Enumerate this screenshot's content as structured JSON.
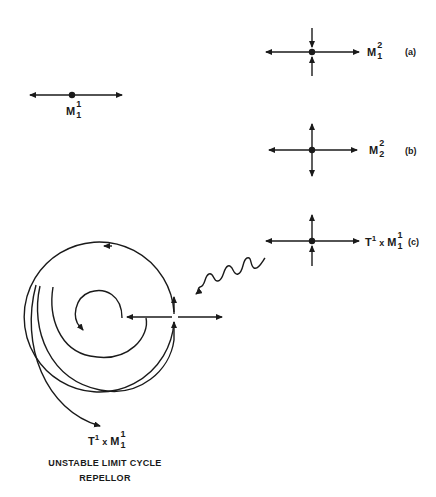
{
  "figure": {
    "colors": {
      "ink": "#1a1a1a",
      "background": "#ffffff"
    },
    "manifold_left": {
      "base": "M",
      "sup": "1",
      "sub": "1"
    },
    "panel_a": {
      "base": "M",
      "sup": "2",
      "sub": "1",
      "tag": "(a)"
    },
    "panel_b": {
      "base": "M",
      "sup": "2",
      "sub": "2",
      "tag": "(b)"
    },
    "panel_c": {
      "prefix": "T",
      "prefix_sup": "1",
      "times": "x",
      "base": "M",
      "sup": "1",
      "sub": "1",
      "tag": "(c)"
    },
    "spiral": {
      "label": {
        "prefix": "T",
        "prefix_sup": "1",
        "times": "x",
        "base": "M",
        "sup": "1",
        "sub": "1"
      },
      "caption_line1": "UNSTABLE LIMIT CYCLE",
      "caption_line2": "REPELLOR"
    }
  }
}
